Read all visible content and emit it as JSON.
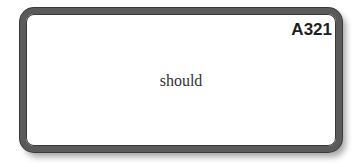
{
  "card": {
    "code": "A321",
    "word": "should",
    "border_color": "#5a5a5a"
  }
}
